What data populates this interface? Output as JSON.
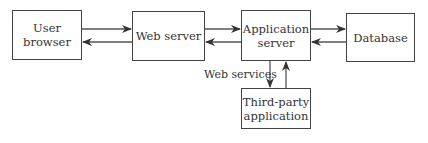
{
  "nodes": {
    "user_browser": {
      "label": "User\nbrowser",
      "line1": "User",
      "line2": "browser"
    },
    "web_server": {
      "label": "Web server"
    },
    "app_server": {
      "label": "Application\nserver",
      "line1": "Application",
      "line2": "server"
    },
    "database": {
      "label": "Database"
    },
    "third_party": {
      "label": "Third-party\napplication",
      "line1": "Third-party",
      "line2": "application"
    }
  },
  "edges": [
    {
      "from": "user_browser",
      "to": "web_server"
    },
    {
      "from": "web_server",
      "to": "user_browser"
    },
    {
      "from": "web_server",
      "to": "app_server"
    },
    {
      "from": "app_server",
      "to": "web_server"
    },
    {
      "from": "app_server",
      "to": "database"
    },
    {
      "from": "database",
      "to": "app_server"
    },
    {
      "from": "app_server",
      "to": "third_party",
      "label": "Web services"
    },
    {
      "from": "third_party",
      "to": "app_server"
    }
  ],
  "edge_labels": {
    "web_services": "Web services"
  },
  "colors": {
    "stroke": "#444444",
    "text": "#333333",
    "background": "#ffffff"
  }
}
